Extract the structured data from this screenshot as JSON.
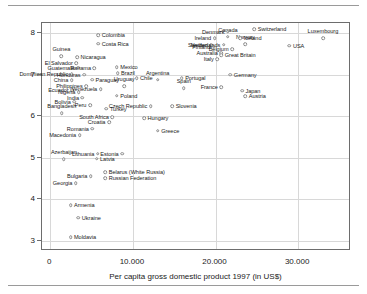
{
  "figure": {
    "x_axis_title": "Per capita gross domestic product 1997 (in US$)",
    "y_axis_title": "Satisfaction with life in the 1990s (on a scale of 0—10)"
  },
  "chart_data": {
    "type": "scatter",
    "title": "",
    "xlabel": "Per capita gross domestic product 1997 (in US$)",
    "ylabel": "Satisfaction with life in the 1990s (on a scale of 0—10)",
    "xlim": [
      -1000,
      36400
    ],
    "ylim": [
      2.75,
      8.25
    ],
    "xticks": [
      0,
      10000,
      20000,
      30000
    ],
    "xticklabels": [
      "0",
      "10.000",
      "20.000",
      "30.000"
    ],
    "yticks": [
      3,
      4,
      5,
      6,
      7,
      8
    ],
    "yticklabels": [
      "3",
      "4",
      "5",
      "6",
      "7",
      "8"
    ],
    "grid": true,
    "legend": "none",
    "marker": "open-circle",
    "points": [
      {
        "label": "Colombia",
        "x": 5800,
        "y": 7.95,
        "side": "r"
      },
      {
        "label": "Costa Rica",
        "x": 5800,
        "y": 7.75,
        "side": "r"
      },
      {
        "label": "Guinea",
        "x": 1350,
        "y": 7.45,
        "side": "c"
      },
      {
        "label": "Nicaragua",
        "x": 3250,
        "y": 7.42,
        "side": "r"
      },
      {
        "label": "El Salvador",
        "x": 3150,
        "y": 7.28,
        "side": "l"
      },
      {
        "label": "Guatemala",
        "x": 3350,
        "y": 7.17,
        "side": "l"
      },
      {
        "label": "Panama",
        "x": 5350,
        "y": 7.16,
        "side": "l"
      },
      {
        "label": "Mexico",
        "x": 8050,
        "y": 7.18,
        "side": "r"
      },
      {
        "label": "Dominican Republic",
        "x": 2600,
        "y": 7.02,
        "side": "l"
      },
      {
        "label": "Honduras",
        "x": 4100,
        "y": 7.0,
        "side": "l"
      },
      {
        "label": "Brazil",
        "x": 8150,
        "y": 7.04,
        "side": "r"
      },
      {
        "label": "Chile",
        "x": 10450,
        "y": 6.92,
        "side": "r"
      },
      {
        "label": "China",
        "x": 2600,
        "y": 6.87,
        "side": "l"
      },
      {
        "label": "Paraguay",
        "x": 5050,
        "y": 6.88,
        "side": "r"
      },
      {
        "label": "Uruguay",
        "x": 8950,
        "y": 6.72,
        "side": "c"
      },
      {
        "label": "Philippines",
        "x": 4350,
        "y": 6.72,
        "side": "l"
      },
      {
        "label": "Ecuador",
        "x": 2650,
        "y": 6.63,
        "side": "l"
      },
      {
        "label": "Nigeria",
        "x": 3450,
        "y": 6.58,
        "side": "l"
      },
      {
        "label": "Venezuela",
        "x": 6100,
        "y": 6.66,
        "side": "l"
      },
      {
        "label": "Poland",
        "x": 8050,
        "y": 6.5,
        "side": "r"
      },
      {
        "label": "India",
        "x": 3900,
        "y": 6.45,
        "side": "l"
      },
      {
        "label": "Bolivia",
        "x": 2900,
        "y": 6.35,
        "side": "l"
      },
      {
        "label": "Peru",
        "x": 4800,
        "y": 6.27,
        "side": "l"
      },
      {
        "label": "Turkey",
        "x": 6800,
        "y": 6.18,
        "side": "r"
      },
      {
        "label": "Bangladesh",
        "x": 1400,
        "y": 6.08,
        "side": "c"
      },
      {
        "label": "Czech Republic",
        "x": 12150,
        "y": 6.24,
        "side": "l"
      },
      {
        "label": "Slovenia",
        "x": 14750,
        "y": 6.25,
        "side": "r"
      },
      {
        "label": "Hungary",
        "x": 11350,
        "y": 5.95,
        "side": "r"
      },
      {
        "label": "South Africa",
        "x": 7500,
        "y": 5.98,
        "side": "l"
      },
      {
        "label": "Croatia",
        "x": 7100,
        "y": 5.85,
        "side": "l"
      },
      {
        "label": "Greece",
        "x": 13000,
        "y": 5.65,
        "side": "r"
      },
      {
        "label": "Romania",
        "x": 5100,
        "y": 5.7,
        "side": "l"
      },
      {
        "label": "Macedonia",
        "x": 3550,
        "y": 5.55,
        "side": "l"
      },
      {
        "label": "Lithuania",
        "x": 5750,
        "y": 5.1,
        "side": "l"
      },
      {
        "label": "Estonia",
        "x": 8700,
        "y": 5.1,
        "side": "l"
      },
      {
        "label": "Latvia",
        "x": 5600,
        "y": 4.98,
        "side": "r"
      },
      {
        "label": "Azerbaijan",
        "x": 1650,
        "y": 4.96,
        "side": "c"
      },
      {
        "label": "Belarus (White Russia)",
        "x": 6650,
        "y": 4.65,
        "side": "r"
      },
      {
        "label": "Russian Federation",
        "x": 6650,
        "y": 4.5,
        "side": "r"
      },
      {
        "label": "Bulgaria",
        "x": 4900,
        "y": 4.55,
        "side": "l"
      },
      {
        "label": "Georgia",
        "x": 3100,
        "y": 4.38,
        "side": "l"
      },
      {
        "label": "Armenia",
        "x": 2450,
        "y": 3.85,
        "side": "r"
      },
      {
        "label": "Ukraine",
        "x": 3400,
        "y": 3.55,
        "side": "r"
      },
      {
        "label": "Moldavia",
        "x": 2450,
        "y": 3.08,
        "side": "r"
      },
      {
        "label": "Argentina",
        "x": 13000,
        "y": 6.88,
        "side": "c"
      },
      {
        "label": "Portugal",
        "x": 15900,
        "y": 6.92,
        "side": "r"
      },
      {
        "label": "Spain",
        "x": 16150,
        "y": 6.68,
        "side": "c"
      },
      {
        "label": "France",
        "x": 20700,
        "y": 6.7,
        "side": "l"
      },
      {
        "label": "Germany",
        "x": 21800,
        "y": 7.0,
        "side": "r"
      },
      {
        "label": "Japan",
        "x": 23200,
        "y": 6.62,
        "side": "r"
      },
      {
        "label": "Austria",
        "x": 23600,
        "y": 6.48,
        "side": "r"
      },
      {
        "label": "Italy",
        "x": 20200,
        "y": 7.38,
        "side": "l"
      },
      {
        "label": "Australia",
        "x": 20700,
        "y": 7.52,
        "side": "l"
      },
      {
        "label": "Great Britain",
        "x": 20700,
        "y": 7.48,
        "side": "r"
      },
      {
        "label": "Belgium",
        "x": 22000,
        "y": 7.62,
        "side": "l"
      },
      {
        "label": "Sweden",
        "x": 19500,
        "y": 7.72,
        "side": "l"
      },
      {
        "label": "Finland",
        "x": 19800,
        "y": 7.68,
        "side": "l"
      },
      {
        "label": "Netherlands",
        "x": 21000,
        "y": 7.73,
        "side": "l"
      },
      {
        "label": "Norway",
        "x": 23600,
        "y": 7.74,
        "side": "c"
      },
      {
        "label": "USA",
        "x": 28950,
        "y": 7.7,
        "side": "r"
      },
      {
        "label": "Ireland",
        "x": 19900,
        "y": 7.88,
        "side": "l"
      },
      {
        "label": "Canada",
        "x": 21500,
        "y": 7.92,
        "side": "c"
      },
      {
        "label": "Iceland",
        "x": 23000,
        "y": 7.88,
        "side": "r"
      },
      {
        "label": "Denmark",
        "x": 21500,
        "y": 8.04,
        "side": "l"
      },
      {
        "label": "Switzerland",
        "x": 24700,
        "y": 8.1,
        "side": "r"
      },
      {
        "label": "Luxembourg",
        "x": 33000,
        "y": 7.88,
        "side": "c"
      }
    ]
  }
}
